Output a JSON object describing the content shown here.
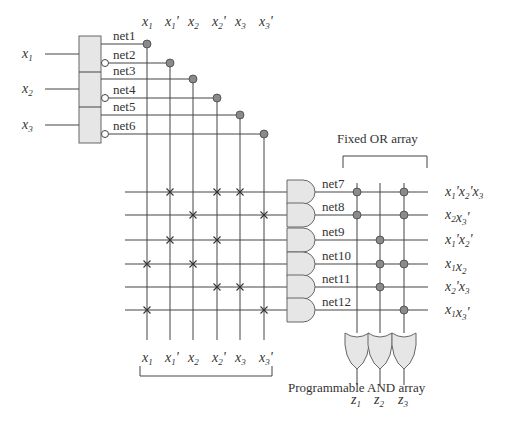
{
  "inputs": [
    {
      "name": "x",
      "sub": "1"
    },
    {
      "name": "x",
      "sub": "2"
    },
    {
      "name": "x",
      "sub": "3"
    }
  ],
  "input_nets": [
    "net1",
    "net2",
    "net3",
    "net4",
    "net5",
    "net6"
  ],
  "literals": [
    {
      "name": "x",
      "sub": "1",
      "prime": ""
    },
    {
      "name": "x",
      "sub": "1",
      "prime": "'"
    },
    {
      "name": "x",
      "sub": "2",
      "prime": ""
    },
    {
      "name": "x",
      "sub": "2",
      "prime": "'"
    },
    {
      "name": "x",
      "sub": "3",
      "prime": ""
    },
    {
      "name": "x",
      "sub": "3",
      "prime": "'"
    }
  ],
  "product_terms": [
    {
      "net": "net7",
      "literals": [
        1,
        3,
        4
      ],
      "label": [
        [
          "x",
          "1",
          "'"
        ],
        [
          "x",
          "2",
          "'"
        ],
        [
          "x",
          "3",
          ""
        ]
      ]
    },
    {
      "net": "net8",
      "literals": [
        2,
        5
      ],
      "label": [
        [
          "x",
          "2",
          ""
        ],
        [
          "x",
          "3",
          "'"
        ]
      ]
    },
    {
      "net": "net9",
      "literals": [
        1,
        3
      ],
      "label": [
        [
          "x",
          "1",
          "'"
        ],
        [
          "x",
          "2",
          "'"
        ]
      ]
    },
    {
      "net": "net10",
      "literals": [
        0,
        2
      ],
      "label": [
        [
          "x",
          "1",
          ""
        ],
        [
          "x",
          "2",
          ""
        ]
      ]
    },
    {
      "net": "net11",
      "literals": [
        3,
        4
      ],
      "label": [
        [
          "x",
          "2",
          "'"
        ],
        [
          "x",
          "3",
          ""
        ]
      ]
    },
    {
      "net": "net12",
      "literals": [
        0,
        5
      ],
      "label": [
        [
          "x",
          "1",
          ""
        ],
        [
          "x",
          "3",
          "'"
        ]
      ]
    }
  ],
  "outputs": [
    {
      "name": "z",
      "sub": "1",
      "terms": [
        0,
        1
      ]
    },
    {
      "name": "z",
      "sub": "2",
      "terms": [
        2,
        3,
        4
      ]
    },
    {
      "name": "z",
      "sub": "3",
      "terms": [
        0,
        1,
        3,
        5
      ]
    }
  ],
  "labels": {
    "and_array": "Programmable AND array",
    "or_array": "Fixed OR array"
  }
}
